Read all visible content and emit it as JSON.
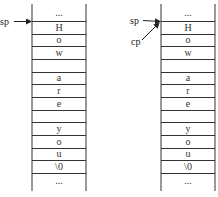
{
  "diagram": {
    "left_stack": {
      "cells": [
        "...",
        "H",
        "o",
        "w",
        "",
        "a",
        "r",
        "e",
        "",
        "y",
        "o",
        "u",
        "\\0",
        "..."
      ],
      "pointers": [
        {
          "label": "sp",
          "target_cell": 1
        }
      ]
    },
    "right_stack": {
      "cells": [
        "...",
        "H",
        "o",
        "w",
        "",
        "a",
        "r",
        "e",
        "",
        "y",
        "o",
        "u",
        "\\0",
        "..."
      ],
      "pointers": [
        {
          "label": "sp",
          "target_cell": 1
        },
        {
          "label": "cp",
          "target_cell": 1
        }
      ]
    },
    "colors": {
      "line": "#333333",
      "background": "#ffffff"
    }
  }
}
